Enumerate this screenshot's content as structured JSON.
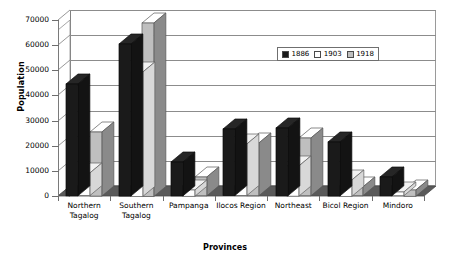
{
  "chart_data": {
    "type": "bar",
    "title": "",
    "xlabel": "Provinces",
    "ylabel": "Population",
    "ylim": [
      0,
      70000
    ],
    "yticks": [
      0,
      10000,
      20000,
      30000,
      40000,
      50000,
      60000,
      70000
    ],
    "ytick_labels": [
      "0",
      "10000",
      "20000",
      "30000",
      "40000",
      "50000",
      "60000",
      "70000"
    ],
    "grid": true,
    "legend_position": "upper-right-inside",
    "style": "3d-clustered-column",
    "categories": [
      "Northern Tagalog",
      "Southern Tagalog",
      "Pampanga",
      "Ilocos Region",
      "Northeast",
      "Bicol Region",
      "Mindoro"
    ],
    "series": [
      {
        "name": "1886",
        "color": "#1a1a1a",
        "values": [
          44500,
          60500,
          13500,
          26500,
          27000,
          21500,
          7500
        ]
      },
      {
        "name": "1903",
        "color": "#ffffff",
        "values": [
          9000,
          49500,
          2500,
          20500,
          12000,
          6500,
          1500
        ]
      },
      {
        "name": "1918",
        "color": "#bfbfbf",
        "values": [
          25500,
          69000,
          7500,
          21000,
          23000,
          3500,
          2500
        ]
      }
    ]
  },
  "legend": {
    "items": [
      {
        "label": "1886"
      },
      {
        "label": "1903"
      },
      {
        "label": "1918"
      }
    ]
  },
  "colors": {
    "series_1886": "#1a1a1a",
    "series_1903": "#ffffff",
    "series_1918": "#bfbfbf",
    "grid": "#8c8c8c",
    "floor": "#555555",
    "background": "#ffffff"
  }
}
